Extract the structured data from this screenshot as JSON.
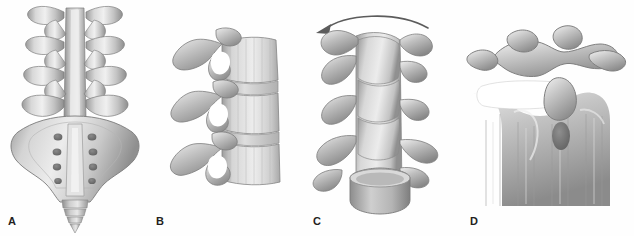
{
  "figure": {
    "background_color": "#fefefe",
    "ink_color": "#231f20",
    "bone_light": "#f2f2f2",
    "bone_mid": "#b8b8b8",
    "bone_dark": "#8a8a8a",
    "bone_shadow": "#6e6e6e",
    "foramen_color": "#ffffff"
  },
  "panels": [
    {
      "id": "A",
      "label": "A",
      "label_x": 8,
      "label_y": 216,
      "view": "posterior",
      "content": "lumbar vertebrae with sacrum and coccyx",
      "vertebra_count": 5,
      "sacral_foramina_pairs": 4,
      "coccyx_segments": 4,
      "has_arrow": false
    },
    {
      "id": "B",
      "label": "B",
      "label_x": 156,
      "label_y": 216,
      "view": "lateral",
      "content": "three lumbar vertebrae with intervertebral discs and foramina",
      "vertebra_count": 3,
      "disc_count": 2,
      "foramen_count": 3,
      "has_arrow": false
    },
    {
      "id": "C",
      "label": "C",
      "label_x": 313,
      "label_y": 216,
      "view": "oblique-rotated",
      "content": "lumbar vertebral column rotated, showing facet joints",
      "vertebra_count": 4,
      "has_arrow": true,
      "arrow_direction": "counterclockwise-left",
      "arrow_label": "rotation-arrow"
    },
    {
      "id": "D",
      "label": "D",
      "label_x": 470,
      "label_y": 216,
      "view": "close-up-oblique",
      "content": "magnified vertebral segment with articular processes and disc space",
      "has_arrow": false
    }
  ]
}
